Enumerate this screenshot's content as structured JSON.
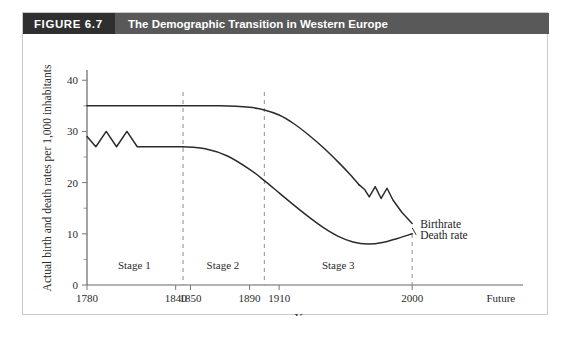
{
  "figure": {
    "number_label": "FIGURE 6.7",
    "title": "The Demographic Transition in Western Europe",
    "header_bg": "#595959",
    "number_box_bg": "#2f2f2f",
    "header_text_color": "#ffffff",
    "frame_border": "#c9c9c9",
    "background": "#ffffff"
  },
  "chart_data": {
    "type": "line",
    "title": "The Demographic Transition in Western Europe",
    "xlabel": "Year",
    "ylabel": "Actual birth and death rates per 1,000 inhabitants",
    "ylim": [
      0,
      42
    ],
    "yticks": [
      0,
      10,
      20,
      30,
      40
    ],
    "yticks_minor": [
      5,
      15,
      25,
      35
    ],
    "xtick_labels": [
      "1780",
      "1840",
      "1850",
      "1890",
      "1910",
      "2000",
      "Future"
    ],
    "xtick_years": [
      1780,
      1840,
      1850,
      1890,
      1910,
      2000,
      2060
    ],
    "xlim": [
      1780,
      2075
    ],
    "grid": false,
    "legend_position": "right-inline",
    "curve_color": "#2b2b2b",
    "stage_dividers": [
      1845,
      1900,
      2000
    ],
    "annotations": [
      {
        "text": "Stage 1",
        "x_center": 1812,
        "y": 3.2
      },
      {
        "text": "Stage 2",
        "x_center": 1872,
        "y": 3.2
      },
      {
        "text": "Stage 3",
        "x_center": 1950,
        "y": 3.2
      }
    ],
    "series": [
      {
        "name": "Birthrate",
        "label": "Birthrate",
        "points": [
          [
            1780,
            35
          ],
          [
            1800,
            35
          ],
          [
            1820,
            35
          ],
          [
            1845,
            35
          ],
          [
            1870,
            35
          ],
          [
            1890,
            34.7
          ],
          [
            1900,
            34.2
          ],
          [
            1910,
            33.2
          ],
          [
            1920,
            31.5
          ],
          [
            1930,
            29.3
          ],
          [
            1940,
            26.8
          ],
          [
            1950,
            24.0
          ],
          [
            1958,
            21.6
          ],
          [
            1964,
            19.6
          ],
          [
            1968,
            18.6
          ],
          [
            1971,
            17.2
          ],
          [
            1975,
            19.2
          ],
          [
            1979,
            16.9
          ],
          [
            1983,
            18.9
          ],
          [
            1987,
            16.6
          ],
          [
            1993,
            14.2
          ],
          [
            2000,
            12.0
          ]
        ]
      },
      {
        "name": "Death rate",
        "label": "Death rate",
        "points": [
          [
            1780,
            29.0
          ],
          [
            1786,
            27.0
          ],
          [
            1793,
            30.0
          ],
          [
            1800,
            27.0
          ],
          [
            1807,
            30.0
          ],
          [
            1814,
            27.0
          ],
          [
            1845,
            27.0
          ],
          [
            1860,
            26.6
          ],
          [
            1875,
            25.2
          ],
          [
            1890,
            22.6
          ],
          [
            1900,
            20.4
          ],
          [
            1910,
            18.0
          ],
          [
            1920,
            15.6
          ],
          [
            1930,
            13.3
          ],
          [
            1940,
            11.2
          ],
          [
            1950,
            9.5
          ],
          [
            1960,
            8.4
          ],
          [
            1970,
            8.0
          ],
          [
            1980,
            8.3
          ],
          [
            1990,
            9.1
          ],
          [
            2000,
            10.0
          ]
        ]
      }
    ]
  }
}
